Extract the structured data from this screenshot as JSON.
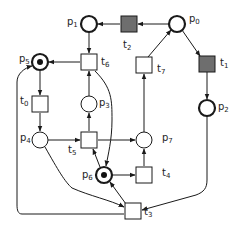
{
  "diagram": {
    "colors": {
      "stroke": "#1a1a1a",
      "fired_transition": "#6e6e6e",
      "token": "#111111"
    },
    "places": [
      {
        "id": "p0",
        "label": "p",
        "sub": "0",
        "x": 177,
        "y": 24,
        "thick": true,
        "tokens": 0
      },
      {
        "id": "p1",
        "label": "p",
        "sub": "1",
        "x": 89,
        "y": 24,
        "thick": true,
        "tokens": 0
      },
      {
        "id": "p2",
        "label": "p",
        "sub": "2",
        "x": 207,
        "y": 108,
        "thick": true,
        "tokens": 0
      },
      {
        "id": "p3",
        "label": "p",
        "sub": "3",
        "x": 89,
        "y": 104,
        "thick": false,
        "tokens": 0
      },
      {
        "id": "p4",
        "label": "p",
        "sub": "4",
        "x": 40,
        "y": 140,
        "thick": false,
        "tokens": 0
      },
      {
        "id": "p5",
        "label": "p",
        "sub": "5",
        "x": 40,
        "y": 62,
        "thick": true,
        "tokens": 1
      },
      {
        "id": "p6",
        "label": "p",
        "sub": "6",
        "x": 104,
        "y": 175,
        "thick": true,
        "tokens": 1
      },
      {
        "id": "p7",
        "label": "p",
        "sub": "7",
        "x": 144,
        "y": 140,
        "thick": false,
        "tokens": 0
      }
    ],
    "transitions": [
      {
        "id": "t0",
        "label": "t",
        "sub": "0",
        "x": 40,
        "y": 104,
        "filled": false
      },
      {
        "id": "t1",
        "label": "t",
        "sub": "1",
        "x": 207,
        "y": 64,
        "filled": true
      },
      {
        "id": "t2",
        "label": "t",
        "sub": "2",
        "x": 129,
        "y": 24,
        "filled": true
      },
      {
        "id": "t3",
        "label": "t",
        "sub": "3",
        "x": 133,
        "y": 211,
        "filled": false
      },
      {
        "id": "t4",
        "label": "t",
        "sub": "4",
        "x": 144,
        "y": 175,
        "filled": false
      },
      {
        "id": "t5",
        "label": "t",
        "sub": "5",
        "x": 89,
        "y": 140,
        "filled": false
      },
      {
        "id": "t6",
        "label": "t",
        "sub": "6",
        "x": 89,
        "y": 62,
        "filled": false
      },
      {
        "id": "t7",
        "label": "t",
        "sub": "7",
        "x": 144,
        "y": 65,
        "filled": false
      }
    ]
  }
}
